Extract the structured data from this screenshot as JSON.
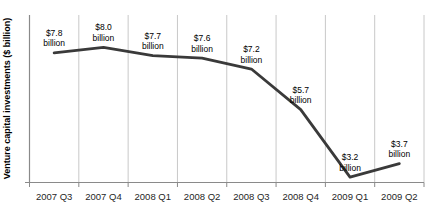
{
  "chart_data": {
    "type": "line",
    "title": "",
    "xlabel": "",
    "ylabel": "Venture capital investments ($ billion)",
    "categories": [
      "2007 Q3",
      "2007 Q4",
      "2008 Q1",
      "2008 Q2",
      "2008 Q3",
      "2008 Q4",
      "2009 Q1",
      "2009 Q2"
    ],
    "values": [
      7.8,
      8.0,
      7.7,
      7.6,
      7.2,
      5.7,
      3.2,
      3.7
    ],
    "data_labels": [
      "$7.8\nbillion",
      "$8.0\nbillion",
      "$7.7\nbillion",
      "$7.6\nbillion",
      "$7.2\nbillion",
      "$5.7\nbillion",
      "$3.2\nbillion",
      "$3.7\nbillion"
    ],
    "ylim": [
      3,
      9.2
    ],
    "y_tick_labels_shown": false,
    "grid": "vertical-only",
    "legend": "none",
    "markers": "none",
    "colors": {
      "line": "#3a3a3a",
      "gridline": "#c8c8c8",
      "axis": "#8a8a8a",
      "data_label": "#000000",
      "tick_label": "#1f1f1f",
      "background": "#ffffff"
    }
  }
}
